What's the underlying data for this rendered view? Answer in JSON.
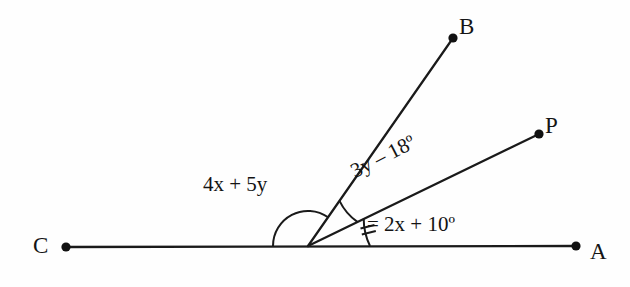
{
  "figure": {
    "type": "geometry-angle-diagram",
    "background_color": "#fefefe",
    "stroke_color": "#1a1a1a",
    "width": 630,
    "height": 287
  },
  "points": [
    {
      "name": "C",
      "label": "C",
      "x": 66,
      "y": 247,
      "label_x": 33,
      "label_y": 234
    },
    {
      "name": "A",
      "label": "A",
      "x": 576,
      "y": 246,
      "label_x": 590,
      "label_y": 240
    },
    {
      "name": "B",
      "label": "B",
      "x": 453,
      "y": 38,
      "label_x": 459,
      "label_y": 15
    },
    {
      "name": "P",
      "label": "P",
      "x": 539,
      "y": 134,
      "label_x": 545,
      "label_y": 114
    }
  ],
  "vertex": {
    "name": "O",
    "x": 308,
    "y": 246
  },
  "rays": [
    {
      "name": "ray-OC",
      "from": "O",
      "to": "C",
      "angle_deg": 180
    },
    {
      "name": "ray-OA",
      "from": "O",
      "to": "A",
      "angle_deg": 0
    },
    {
      "name": "ray-OB",
      "from": "O",
      "to": "B",
      "angle_deg": 55
    },
    {
      "name": "ray-OP",
      "from": "O",
      "to": "P",
      "angle_deg": 26
    }
  ],
  "angles": [
    {
      "name": "angle-COB",
      "label": "4x + 5y",
      "between": [
        "ray-OC",
        "ray-OB"
      ],
      "arc_radius": 35,
      "tick_marks": 0,
      "label_rotation_deg": 0
    },
    {
      "name": "angle-BOP",
      "label": "3y – 18º",
      "between": [
        "ray-OB",
        "ray-OP"
      ],
      "arc_radius": 55,
      "tick_marks": 0,
      "label_rotation_deg": -27
    },
    {
      "name": "angle-POA",
      "label": "2x + 10º",
      "label_with_marker": "= 2x + 10º",
      "between": [
        "ray-OP",
        "ray-OA"
      ],
      "arc_radius": 62,
      "tick_marks": 2,
      "label_rotation_deg": 0
    }
  ]
}
